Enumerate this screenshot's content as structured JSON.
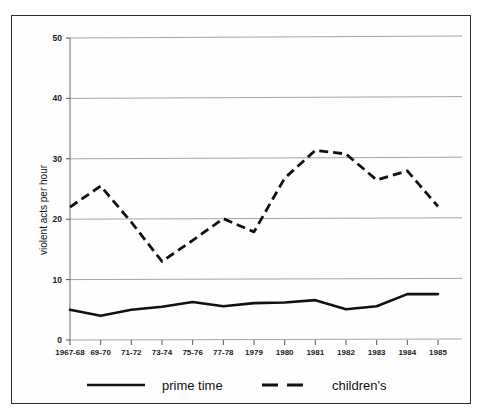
{
  "chart_data": {
    "type": "line",
    "title": "",
    "xlabel": "",
    "ylabel": "violent acts per hour",
    "ylim": [
      0,
      50
    ],
    "yticks": [
      0,
      10,
      20,
      30,
      40,
      50
    ],
    "grid": true,
    "legend_position": "bottom",
    "categories": [
      "1967-68",
      "69-70",
      "71-72",
      "73-74",
      "75-76",
      "77-78",
      "1979",
      "1980",
      "1981",
      "1982",
      "1983",
      "1984",
      "1985"
    ],
    "series": [
      {
        "name": "prime time",
        "style": "solid",
        "color": "#111111",
        "values": [
          5.0,
          4.0,
          5.0,
          5.5,
          6.3,
          5.6,
          6.1,
          6.2,
          6.6,
          5.1,
          5.6,
          7.6,
          7.6
        ]
      },
      {
        "name": "children's",
        "style": "dashed",
        "color": "#111111",
        "values": [
          22.0,
          25.5,
          19.5,
          13.0,
          16.5,
          20.1,
          17.9,
          26.8,
          31.4,
          30.8,
          26.5,
          28.0,
          22.1
        ]
      }
    ]
  },
  "axes": {
    "y_tick_labels": [
      "50",
      "40",
      "30",
      "20",
      "10",
      "0"
    ],
    "y_axis_title": "violent acts per hour",
    "x_tick_labels": [
      "1967-68",
      "69-70",
      "71-72",
      "73-74",
      "75-76",
      "77-78",
      "1979",
      "1980",
      "1981",
      "1982",
      "1983",
      "1984",
      "1985"
    ]
  },
  "legend": {
    "entries": [
      {
        "label": "prime time",
        "style": "solid"
      },
      {
        "label": "children's",
        "style": "dashed"
      }
    ]
  }
}
